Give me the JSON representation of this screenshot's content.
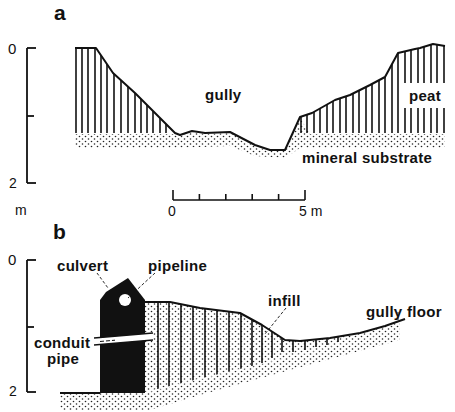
{
  "panel_a": {
    "label": "a",
    "vertical_scale": {
      "top": "0",
      "bottom": "2",
      "unit": "m"
    },
    "labels": {
      "gully": "gully",
      "peat": "peat",
      "mineral_substrate": "mineral substrate"
    },
    "horizontal_scale": {
      "start": "0",
      "end": "5 m"
    }
  },
  "panel_b": {
    "label": "b",
    "vertical_scale": {
      "top": "0",
      "bottom": "2"
    },
    "labels": {
      "culvert": "culvert",
      "pipeline": "pipeline",
      "infill": "infill",
      "gully_floor": "gully floor",
      "conduit_pipe_line1": "conduit",
      "conduit_pipe_line2": "pipe"
    }
  },
  "colors": {
    "ink": "#111111",
    "background": "#ffffff"
  }
}
